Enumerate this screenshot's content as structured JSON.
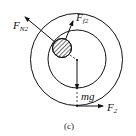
{
  "figure": {
    "caption": "(c)",
    "labels": {
      "normal_force": {
        "base": "F",
        "sub": "N2"
      },
      "friction_force": {
        "base": "F",
        "sub": "f2"
      },
      "gravity": {
        "text": "mg"
      },
      "applied_force": {
        "base": "F",
        "sub": "2"
      }
    },
    "geometry": {
      "outer_circle": {
        "cx": 76.5,
        "cy": 59.5,
        "r": 46
      },
      "inner_circle": {
        "cx": 77,
        "cy": 59,
        "r": 29
      },
      "ball": {
        "cx": 62,
        "cy": 48,
        "r": 9.5
      },
      "color": "#111111"
    }
  }
}
